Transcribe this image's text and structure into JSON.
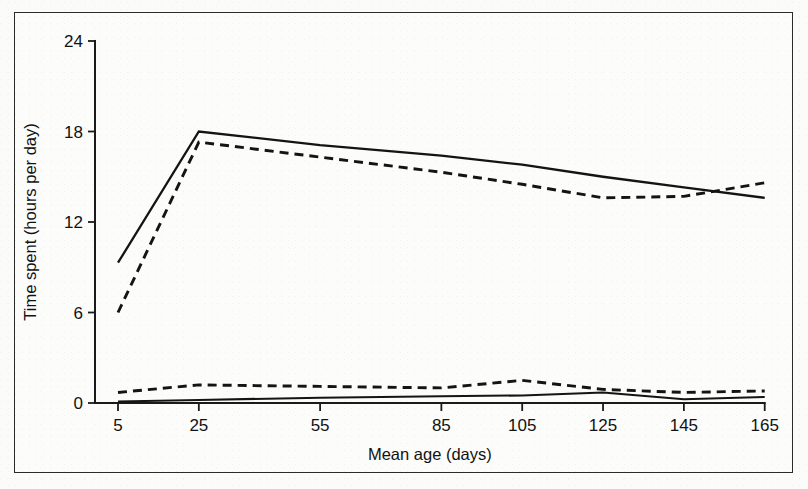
{
  "chart_data": {
    "type": "line",
    "title": "",
    "subtitle": "",
    "xlabel": "Mean age (days)",
    "ylabel": "Time spent (hours per day)",
    "x": [
      5,
      25,
      55,
      85,
      105,
      125,
      145,
      165
    ],
    "xtick_labels": [
      "5",
      "25",
      "55",
      "85",
      "105",
      "125",
      "145",
      "165"
    ],
    "ytick_labels": [
      "0",
      "6",
      "12",
      "18",
      "24"
    ],
    "yticks": [
      0,
      6,
      12,
      18,
      24
    ],
    "xlim": [
      0,
      170
    ],
    "ylim": [
      0,
      24
    ],
    "grid": false,
    "legend_position": "none",
    "series": [
      {
        "name": "upper-solid",
        "style": "solid",
        "values": [
          9.3,
          18.0,
          17.1,
          16.4,
          15.8,
          15.0,
          14.3,
          13.6
        ]
      },
      {
        "name": "upper-dashed",
        "style": "dashed",
        "values": [
          6.0,
          17.3,
          16.3,
          15.3,
          14.5,
          13.6,
          13.7,
          14.6
        ]
      },
      {
        "name": "lower-dashed",
        "style": "dashed",
        "values": [
          0.7,
          1.2,
          1.1,
          1.0,
          1.5,
          0.9,
          0.7,
          0.8
        ]
      },
      {
        "name": "lower-solid",
        "style": "solid",
        "values": [
          0.1,
          0.2,
          0.35,
          0.45,
          0.5,
          0.7,
          0.25,
          0.4
        ]
      }
    ]
  },
  "axes": {
    "x_title": "Mean age (days)",
    "y_title": "Time spent (hours per day)"
  },
  "colors": {
    "ink": "#141414",
    "frame": "#2b2b2b",
    "paper": "#fcfcfb"
  }
}
